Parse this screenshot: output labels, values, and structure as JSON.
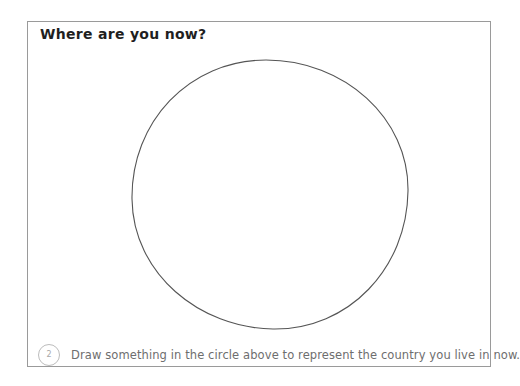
{
  "page": {
    "title": "Where are you now?",
    "step_number": "2",
    "instruction": "Draw something in the circle above to represent the country you live in now."
  },
  "drawing_area": {
    "shape": "hand-drawn empty circle",
    "fill": "none"
  },
  "colors": {
    "background": "#ffffff",
    "frame_border": "#9a9a9a",
    "title_text": "#1f1f1f",
    "circle_stroke": "#555555",
    "instruction_text": "#6e6e6e",
    "badge_border": "#bcbcbc",
    "badge_text": "#a8a8a8"
  }
}
